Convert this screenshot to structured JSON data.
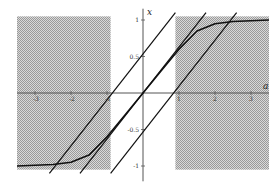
{
  "chart_data": {
    "type": "line",
    "title": "",
    "xlabel": "a",
    "ylabel": "x",
    "xlim": [
      -3.5,
      3.5
    ],
    "ylim": [
      -1.1,
      1.1
    ],
    "grid": false,
    "legend": null,
    "x_ticks": [
      -3,
      -2,
      -1,
      1,
      2,
      3
    ],
    "x_tick_labels": [
      "-3",
      "-2",
      "-1",
      "1",
      "2",
      "3"
    ],
    "y_ticks": [
      1,
      0.5,
      -0.5,
      -1
    ],
    "y_tick_labels": [
      "1",
      "0.5",
      "-0.5",
      "-1"
    ],
    "shaded_regions": [
      {
        "name": "left-region",
        "a_range": [
          -3.5,
          -0.9
        ],
        "x_range": [
          -1.05,
          1.05
        ]
      },
      {
        "name": "right-region",
        "a_range": [
          0.9,
          3.5
        ],
        "x_range": [
          -1.05,
          1.05
        ]
      }
    ],
    "series": [
      {
        "name": "sigmoid-curve",
        "description": "saturating curve, x approaches ±1 for large |a|",
        "points": [
          [
            -3.5,
            -1.0
          ],
          [
            -2.5,
            -0.98
          ],
          [
            -2.0,
            -0.95
          ],
          [
            -1.5,
            -0.85
          ],
          [
            -1.0,
            -0.6
          ],
          [
            -0.5,
            -0.3
          ],
          [
            0,
            0
          ],
          [
            0.5,
            0.3
          ],
          [
            1.0,
            0.6
          ],
          [
            1.5,
            0.85
          ],
          [
            2.0,
            0.95
          ],
          [
            2.5,
            0.98
          ],
          [
            3.5,
            1.0
          ]
        ]
      },
      {
        "name": "line-left",
        "description": "diagonal line shifted left",
        "points": [
          [
            -2.6,
            -1.1
          ],
          [
            0.9,
            1.1
          ]
        ]
      },
      {
        "name": "line-center",
        "description": "diagonal line through origin",
        "points": [
          [
            -1.75,
            -1.1
          ],
          [
            1.75,
            1.1
          ]
        ]
      },
      {
        "name": "line-right",
        "description": "diagonal line shifted right",
        "points": [
          [
            -0.9,
            -1.1
          ],
          [
            2.6,
            1.1
          ]
        ]
      }
    ]
  },
  "layout": {
    "origin_px": [
      143,
      93
    ],
    "px_per_unit_a": 36,
    "px_per_unit_x": 73,
    "shade_color": "#bdbdbd",
    "line_color": "#111111",
    "axis_color": "#555555"
  }
}
